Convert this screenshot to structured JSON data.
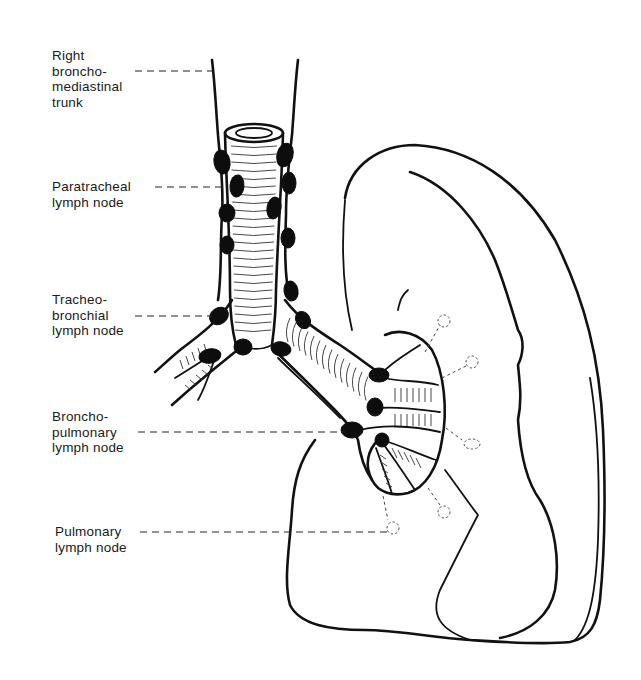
{
  "figure": {
    "labels": [
      {
        "id": "right-bronchomediastinal-trunk",
        "lines": [
          "Right",
          "broncho-",
          "mediastinal",
          "trunk"
        ]
      },
      {
        "id": "paratracheal-lymph-node",
        "lines": [
          "Paratracheal",
          "lymph node"
        ]
      },
      {
        "id": "tracheobronchial-lymph-node",
        "lines": [
          "Tracheo-",
          "bronchial",
          "lymph node"
        ]
      },
      {
        "id": "bronchopulmonary-lymph-node",
        "lines": [
          "Broncho-",
          "pulmonary",
          "lymph node"
        ]
      },
      {
        "id": "pulmonary-lymph-node",
        "lines": [
          "Pulmonary",
          "lymph node"
        ]
      }
    ]
  },
  "colors": {
    "ink": "#111111",
    "node_fill": "#0d0d0d",
    "background": "#ffffff"
  }
}
